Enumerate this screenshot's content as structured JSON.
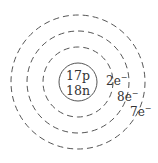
{
  "diagram": {
    "type": "bohr-model",
    "nucleus": {
      "protons": "17p",
      "neutrons": "18n"
    },
    "shells": [
      {
        "electrons": "2e",
        "charge": "−"
      },
      {
        "electrons": "8e",
        "charge": "−"
      },
      {
        "electrons": "7e",
        "charge": "−"
      }
    ],
    "colors": {
      "stroke": "#555555",
      "text": "#333333"
    }
  }
}
